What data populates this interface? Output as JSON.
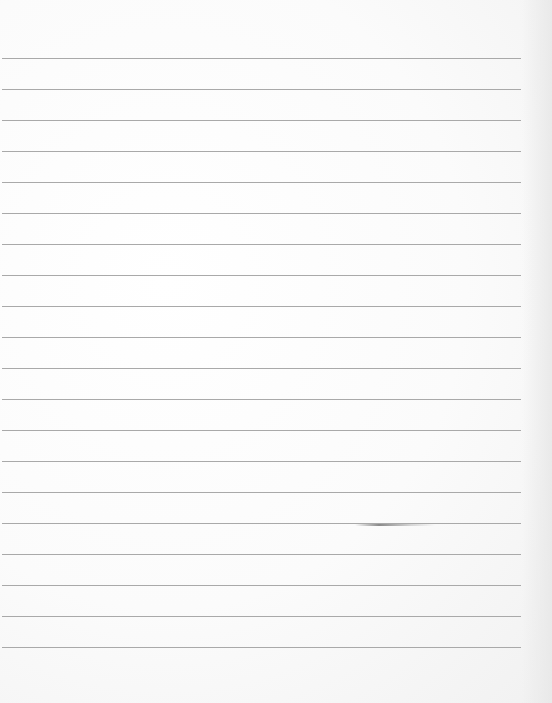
{
  "page": {
    "type": "lined-paper",
    "background_color": "#f9f9f9",
    "rule_color": "#a9a9a9",
    "rule_count": 20,
    "first_rule_y": 58,
    "rule_spacing": 31
  }
}
